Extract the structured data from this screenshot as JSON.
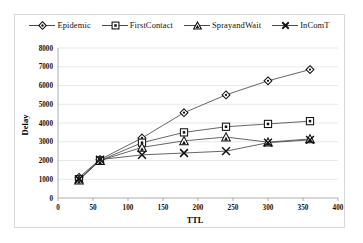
{
  "chart_data": {
    "type": "line",
    "title": "",
    "xlabel": "TTL",
    "ylabel": "Delay",
    "x": [
      30,
      60,
      120,
      180,
      240,
      300,
      360
    ],
    "xlim": [
      0,
      400
    ],
    "ylim": [
      0,
      8000
    ],
    "xticks": [
      "0",
      "50",
      "100",
      "150",
      "200",
      "250",
      "300",
      "350",
      "400"
    ],
    "xtick_values": [
      0,
      50,
      100,
      150,
      200,
      250,
      300,
      350,
      400
    ],
    "yticks": [
      "0",
      "1000",
      "2000",
      "3000",
      "4000",
      "5000",
      "6000",
      "7000",
      "8000"
    ],
    "ytick_values": [
      0,
      1000,
      2000,
      3000,
      4000,
      5000,
      6000,
      7000,
      8000
    ],
    "grid": "horizontal",
    "legend_position": "top",
    "series": [
      {
        "name": "Epidemic",
        "marker": "diamond",
        "values": [
          1100,
          2050,
          3200,
          4550,
          5500,
          6250,
          6850
        ]
      },
      {
        "name": "FirstContact",
        "marker": "square",
        "values": [
          1000,
          2000,
          2950,
          3500,
          3800,
          3950,
          4100
        ]
      },
      {
        "name": "SprayandWait",
        "marker": "triangle",
        "values": [
          950,
          2000,
          2700,
          3050,
          3250,
          2980,
          3150
        ]
      },
      {
        "name": "InComT",
        "marker": "cross",
        "values": [
          1000,
          2050,
          2300,
          2400,
          2500,
          2950,
          3100
        ]
      }
    ],
    "line_color": "#4a4a4a",
    "grid_color": "#e2e2e2",
    "axis_color": "#9a9a9a"
  },
  "legend": {
    "items": [
      {
        "label": "Epidemic",
        "icon": "diamond-marker-icon"
      },
      {
        "label": "FirstContact",
        "icon": "square-marker-icon"
      },
      {
        "label": "SprayandWait",
        "icon": "triangle-marker-icon"
      },
      {
        "label": "InComT",
        "icon": "cross-marker-icon"
      }
    ]
  }
}
